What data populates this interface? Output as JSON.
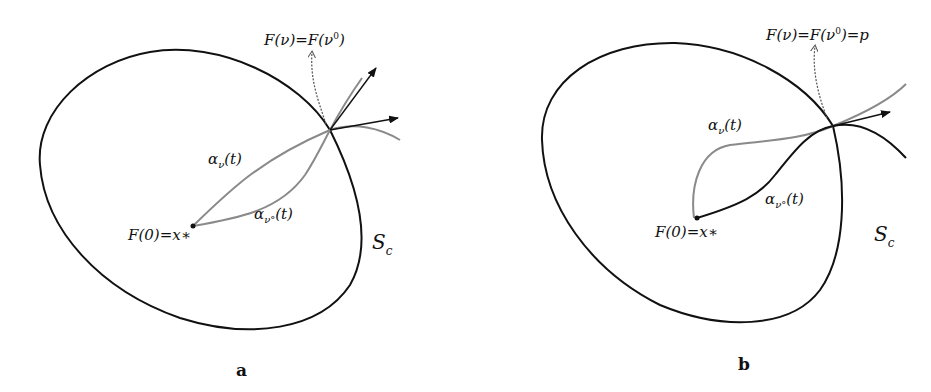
{
  "panels": [
    {
      "id": "a",
      "label": "a",
      "top_label": {
        "lhs": "F(ν)",
        "eq": "=",
        "rhs_base": "F(ν",
        "rhs_sup": "0",
        "rhs_close": ")"
      },
      "curve_v": {
        "base": "α",
        "sub": "ν",
        "arg": "(t)"
      },
      "curve_v0": {
        "base": "α",
        "sub": "ν°",
        "arg": "(t)"
      },
      "origin": {
        "text": "F(0)=x∗"
      },
      "surface": {
        "base": "S",
        "sub": "c"
      }
    },
    {
      "id": "b",
      "label": "b",
      "top_label": {
        "lhs": "F(ν)",
        "eq": "=",
        "rhs_base": "F(ν",
        "rhs_sup": "0",
        "rhs_close": ")=p"
      },
      "curve_v": {
        "base": "α",
        "sub": "ν",
        "arg": "(t)"
      },
      "curve_v0": {
        "base": "α",
        "sub": "ν°",
        "arg": "(t)"
      },
      "origin": {
        "text": "F(0)=x∗"
      },
      "surface": {
        "base": "S",
        "sub": "c"
      }
    }
  ],
  "colors": {
    "ellipse": "#111111",
    "gray_curve": "#8a8a8a",
    "black_curve": "#111111",
    "arrow": "#111111",
    "dotted": "#555555"
  }
}
